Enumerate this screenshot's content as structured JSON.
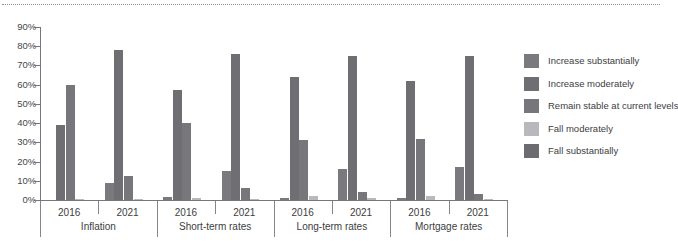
{
  "chart_data": {
    "type": "bar",
    "title": "",
    "xlabel": "",
    "ylabel": "",
    "ylim": [
      0,
      90
    ],
    "grid": false,
    "legend_position": "right",
    "ytick_labels": [
      "90%",
      "80%",
      "70%",
      "60%",
      "50%",
      "40%",
      "30%",
      "20%",
      "10%",
      "0%"
    ],
    "ytick_values": [
      90,
      80,
      70,
      60,
      50,
      40,
      30,
      20,
      10,
      0
    ],
    "groups": [
      "Inflation",
      "Short-term rates",
      "Long-term rates",
      "Mortgage rates"
    ],
    "subcategories": [
      "2016",
      "2021"
    ],
    "categories": [
      "Inflation 2016",
      "Inflation 2021",
      "Short-term rates 2016",
      "Short-term rates 2021",
      "Long-term rates 2016",
      "Long-term rates 2021",
      "Mortgage rates 2016",
      "Mortgage rates 2021"
    ],
    "series": [
      {
        "name": "Increase substantially",
        "color": "#7a7a7e",
        "values": [
          0.0,
          9.0,
          1.5,
          15.0,
          1.0,
          16.0,
          1.0,
          17.0
        ]
      },
      {
        "name": "Increase moderately",
        "color": "#6f6f73",
        "values": [
          39.0,
          78.0,
          57.0,
          76.0,
          64.0,
          75.0,
          62.0,
          75.0
        ]
      },
      {
        "name": "Remain stable at current levels",
        "color": "#77777b",
        "values": [
          60.0,
          12.5,
          40.0,
          6.0,
          31.0,
          4.0,
          31.5,
          3.0
        ]
      },
      {
        "name": "Fall moderately",
        "color": "#b9b9bd",
        "values": [
          0.5,
          0.5,
          1.0,
          0.5,
          2.0,
          1.0,
          2.0,
          0.5
        ]
      },
      {
        "name": "Fall substantially",
        "color": "#6b6b70",
        "values": [
          0.0,
          0.0,
          0.0,
          0.0,
          0.0,
          0.0,
          0.0,
          0.0
        ]
      }
    ]
  },
  "legend": {
    "items": [
      {
        "label": "Increase substantially",
        "color": "#7a7a7e"
      },
      {
        "label": "Increase moderately",
        "color": "#6f6f73"
      },
      {
        "label": "Remain stable at current levels",
        "color": "#77777b"
      },
      {
        "label": "Fall moderately",
        "color": "#b9b9bd"
      },
      {
        "label": "Fall substantially",
        "color": "#6b6b70"
      }
    ]
  },
  "axis": {
    "y_labels": [
      "90%",
      "80%",
      "70%",
      "60%",
      "50%",
      "40%",
      "30%",
      "20%",
      "10%",
      "0%"
    ],
    "x_year_labels": [
      "2016",
      "2021",
      "2016",
      "2021",
      "2016",
      "2021",
      "2016",
      "2021"
    ],
    "x_group_labels": [
      "Inflation",
      "Short-term rates",
      "Long-term rates",
      "Mortgage rates"
    ]
  },
  "colors": {
    "axis": "#77777b",
    "text": "#3d3d41",
    "dotted_rule": "#8d8d8d",
    "background": "#ffffff"
  }
}
